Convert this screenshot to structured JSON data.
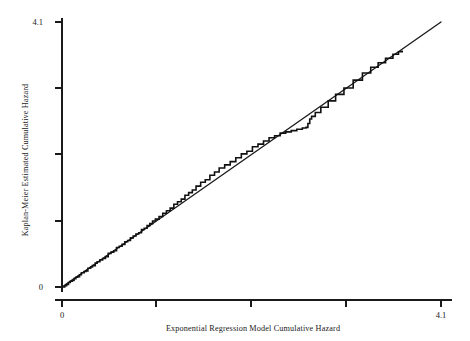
{
  "chart_data": {
    "type": "line",
    "title": "",
    "xlabel": "Exponential Regression Model Cumulative Hazard",
    "ylabel": "Kaplan-Meier Estimated Cumulative Hazard",
    "xlim": [
      0,
      4.1
    ],
    "ylim": [
      0,
      4.1
    ],
    "grid": false,
    "legend": "none",
    "xticks": [
      0,
      1.025,
      2.05,
      3.075,
      4.1
    ],
    "xticklabels": [
      "0",
      "",
      "",
      "",
      "4.1"
    ],
    "yticks": [
      0,
      1.025,
      2.05,
      3.075,
      4.1
    ],
    "yticklabels": [
      "0",
      "",
      "",
      "",
      "4.1"
    ],
    "series": [
      {
        "name": "reference-line",
        "type": "line",
        "description": "45 degree identity reference line y = x",
        "x": [
          0.0,
          4.1
        ],
        "y": [
          0.0,
          4.1
        ]
      },
      {
        "name": "kaplan-meier-step",
        "type": "step",
        "description": "Kaplan-Meier estimated cumulative hazard plotted against exponential regression model cumulative hazard",
        "x": [
          0.0,
          0.03,
          0.05,
          0.07,
          0.09,
          0.11,
          0.13,
          0.15,
          0.17,
          0.19,
          0.21,
          0.24,
          0.26,
          0.28,
          0.31,
          0.33,
          0.36,
          0.38,
          0.41,
          0.44,
          0.47,
          0.5,
          0.53,
          0.56,
          0.59,
          0.62,
          0.65,
          0.68,
          0.71,
          0.74,
          0.77,
          0.8,
          0.83,
          0.86,
          0.89,
          0.92,
          0.95,
          0.98,
          1.01,
          1.05,
          1.09,
          1.13,
          1.17,
          1.21,
          1.25,
          1.29,
          1.33,
          1.37,
          1.41,
          1.45,
          1.5,
          1.55,
          1.6,
          1.65,
          1.7,
          1.76,
          1.82,
          1.88,
          1.94,
          2.0,
          2.06,
          2.12,
          2.18,
          2.24,
          2.3,
          2.36,
          2.42,
          2.48,
          2.54,
          2.6,
          2.64,
          2.66,
          2.68,
          2.7,
          2.74,
          2.8,
          2.88,
          2.96,
          3.05,
          3.15,
          3.25,
          3.34,
          3.42,
          3.5,
          3.58,
          3.64,
          3.68
        ],
        "y": [
          0.0,
          0.02,
          0.04,
          0.07,
          0.09,
          0.1,
          0.13,
          0.15,
          0.16,
          0.19,
          0.22,
          0.24,
          0.25,
          0.29,
          0.31,
          0.33,
          0.37,
          0.39,
          0.42,
          0.44,
          0.47,
          0.52,
          0.54,
          0.56,
          0.61,
          0.63,
          0.66,
          0.7,
          0.72,
          0.76,
          0.79,
          0.82,
          0.84,
          0.89,
          0.91,
          0.95,
          0.98,
          1.02,
          1.05,
          1.09,
          1.14,
          1.18,
          1.22,
          1.28,
          1.32,
          1.36,
          1.42,
          1.46,
          1.5,
          1.56,
          1.62,
          1.66,
          1.73,
          1.78,
          1.84,
          1.89,
          1.94,
          2.0,
          2.06,
          2.1,
          2.17,
          2.21,
          2.26,
          2.31,
          2.34,
          2.38,
          2.4,
          2.42,
          2.44,
          2.46,
          2.47,
          2.53,
          2.6,
          2.64,
          2.7,
          2.78,
          2.88,
          2.98,
          3.08,
          3.2,
          3.31,
          3.4,
          3.47,
          3.54,
          3.6,
          3.64,
          3.66
        ]
      }
    ]
  },
  "axis_labels": {
    "x_title": "Exponential Regression Model Cumulative Hazard",
    "y_title": "Kaplan-Meier Estimated Cumulative Hazard",
    "x_min_label": "0",
    "x_max_label": "4.1",
    "y_min_label": "0",
    "y_max_label": "4.1"
  },
  "colors": {
    "line": "#1b1b1b",
    "axis": "#1a1a1a",
    "background": "#ffffff"
  }
}
